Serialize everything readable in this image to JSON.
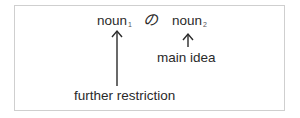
{
  "diagram": {
    "noun1": {
      "base": "noun",
      "subscript": "1"
    },
    "particle": "の",
    "noun2": {
      "base": "noun",
      "subscript": "2"
    },
    "label_noun2": "main idea",
    "label_noun1": "further restriction",
    "arrow_icon_noun1": "up-arrow-long",
    "arrow_icon_noun2": "up-arrow-short"
  }
}
